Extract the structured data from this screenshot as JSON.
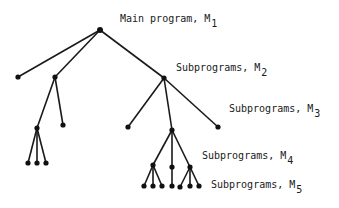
{
  "diagram": {
    "type": "tree",
    "labels": [
      {
        "id": "m1",
        "text": "Main program, M",
        "sub": "1",
        "x": 120,
        "y": 14
      },
      {
        "id": "m2",
        "text": "Subprograms, M",
        "sub": "2",
        "x": 176,
        "y": 63
      },
      {
        "id": "m3",
        "text": "Subprograms, M",
        "sub": "3",
        "x": 229,
        "y": 104
      },
      {
        "id": "m4",
        "text": "Subprograms, M",
        "sub": "4",
        "x": 202,
        "y": 151
      },
      {
        "id": "m5",
        "text": "Subprograms, M",
        "sub": "5",
        "x": 211,
        "y": 180
      }
    ],
    "nodes": [
      {
        "id": "root",
        "x": 100,
        "y": 30
      },
      {
        "id": "a1",
        "x": 18,
        "y": 77
      },
      {
        "id": "a2",
        "x": 55,
        "y": 77
      },
      {
        "id": "a3",
        "x": 164,
        "y": 78
      },
      {
        "id": "b1",
        "x": 37,
        "y": 128
      },
      {
        "id": "b2",
        "x": 63,
        "y": 125
      },
      {
        "id": "c1",
        "x": 28,
        "y": 163
      },
      {
        "id": "c2",
        "x": 37,
        "y": 163
      },
      {
        "id": "c3",
        "x": 46,
        "y": 163
      },
      {
        "id": "d1",
        "x": 128,
        "y": 127
      },
      {
        "id": "d2",
        "x": 172,
        "y": 130
      },
      {
        "id": "d3",
        "x": 218,
        "y": 127
      },
      {
        "id": "e1",
        "x": 153,
        "y": 165
      },
      {
        "id": "e2",
        "x": 172,
        "y": 167
      },
      {
        "id": "e3",
        "x": 190,
        "y": 167
      },
      {
        "id": "f1",
        "x": 144,
        "y": 186
      },
      {
        "id": "f2",
        "x": 153,
        "y": 186
      },
      {
        "id": "f3",
        "x": 162,
        "y": 186
      },
      {
        "id": "f4",
        "x": 172,
        "y": 186
      },
      {
        "id": "f5",
        "x": 180,
        "y": 187
      },
      {
        "id": "f6",
        "x": 190,
        "y": 186
      },
      {
        "id": "f7",
        "x": 199,
        "y": 186
      }
    ],
    "edges": [
      [
        "root",
        "a1"
      ],
      [
        "root",
        "a2"
      ],
      [
        "root",
        "a3"
      ],
      [
        "a2",
        "b1"
      ],
      [
        "a2",
        "b2"
      ],
      [
        "b1",
        "c1"
      ],
      [
        "b1",
        "c2"
      ],
      [
        "b1",
        "c3"
      ],
      [
        "a3",
        "d1"
      ],
      [
        "a3",
        "d2"
      ],
      [
        "a3",
        "d3"
      ],
      [
        "d2",
        "e1"
      ],
      [
        "d2",
        "e2"
      ],
      [
        "d2",
        "e3"
      ],
      [
        "e1",
        "f1"
      ],
      [
        "e1",
        "f2"
      ],
      [
        "e1",
        "f3"
      ],
      [
        "e2",
        "f4"
      ],
      [
        "e3",
        "f5"
      ],
      [
        "e3",
        "f6"
      ],
      [
        "e3",
        "f7"
      ]
    ]
  }
}
